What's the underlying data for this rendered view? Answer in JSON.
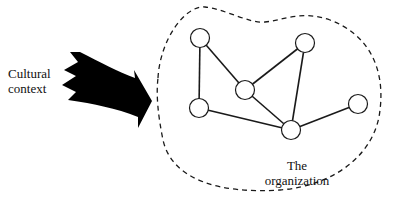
{
  "diagram": {
    "external_label": {
      "line1": "Cultural",
      "line2": "context"
    },
    "organization_label": {
      "line1": "The",
      "line2": "organization"
    },
    "colors": {
      "stroke": "#1a1a1a",
      "arrow_fill": "#000000",
      "node_fill": "#ffffff",
      "background": "#ffffff"
    },
    "nodes": [
      {
        "id": "A",
        "x": 200,
        "y": 38
      },
      {
        "id": "B",
        "x": 305,
        "y": 43
      },
      {
        "id": "C",
        "x": 245,
        "y": 90
      },
      {
        "id": "D",
        "x": 199,
        "y": 108
      },
      {
        "id": "E",
        "x": 291,
        "y": 130
      },
      {
        "id": "F",
        "x": 358,
        "y": 104
      }
    ],
    "edges": [
      [
        "A",
        "D"
      ],
      [
        "A",
        "C"
      ],
      [
        "C",
        "B"
      ],
      [
        "C",
        "E"
      ],
      [
        "D",
        "E"
      ],
      [
        "B",
        "E"
      ],
      [
        "E",
        "F"
      ]
    ]
  }
}
